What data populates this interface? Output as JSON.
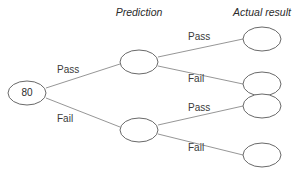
{
  "diagram": {
    "background_color": "#ffffff",
    "node_stroke_color": "#585858",
    "edge_stroke_color": "#8a8a8a",
    "text_color": "#2b2b2b"
  },
  "headers": {
    "prediction": "Prediction",
    "actual_result": "Actual result"
  },
  "root": {
    "label": "80",
    "cx": 27,
    "cy": 93,
    "rx": 19,
    "ry": 12
  },
  "level1": [
    {
      "label": "",
      "cx": 139,
      "cy": 62,
      "rx": 19,
      "ry": 12
    },
    {
      "label": "",
      "cx": 139,
      "cy": 130,
      "rx": 19,
      "ry": 12
    }
  ],
  "level2": [
    {
      "label": "",
      "cx": 262,
      "cy": 39,
      "rx": 19,
      "ry": 12
    },
    {
      "label": "",
      "cx": 262,
      "cy": 84,
      "rx": 19,
      "ry": 12
    },
    {
      "label": "",
      "cx": 262,
      "cy": 106,
      "rx": 19,
      "ry": 12
    },
    {
      "label": "",
      "cx": 262,
      "cy": 155,
      "rx": 19,
      "ry": 12
    }
  ],
  "edges": [
    {
      "id": "root-pass",
      "label": "Pass",
      "x1": 46,
      "y1": 88,
      "x2": 120,
      "y2": 64,
      "lx": 57,
      "ly": 73
    },
    {
      "id": "root-fail",
      "label": "Fail",
      "x1": 46,
      "y1": 98,
      "x2": 120,
      "y2": 127,
      "lx": 57,
      "ly": 122
    },
    {
      "id": "p1-pass",
      "label": "Pass",
      "x1": 158,
      "y1": 57,
      "x2": 243,
      "y2": 39,
      "lx": 188,
      "ly": 40
    },
    {
      "id": "p1-fail",
      "label": "Fail",
      "x1": 158,
      "y1": 66,
      "x2": 243,
      "y2": 84,
      "lx": 188,
      "ly": 82
    },
    {
      "id": "p2-pass",
      "label": "Pass",
      "x1": 158,
      "y1": 125,
      "x2": 243,
      "y2": 106,
      "lx": 188,
      "ly": 111
    },
    {
      "id": "p2-fail",
      "label": "Fail",
      "x1": 158,
      "y1": 134,
      "x2": 243,
      "y2": 155,
      "lx": 188,
      "ly": 151
    }
  ],
  "header_positions": {
    "prediction": {
      "x": 139,
      "y": 16
    },
    "actual_result": {
      "x": 262,
      "y": 16
    }
  }
}
